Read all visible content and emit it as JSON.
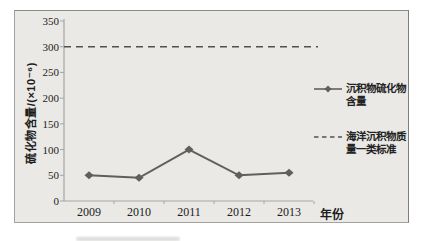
{
  "chart_data": {
    "type": "line",
    "title": "",
    "categories": [
      "2009",
      "2010",
      "2011",
      "2012",
      "2013"
    ],
    "series": [
      {
        "name": "沉积物硫化物含量",
        "style": "solid line with diamond markers",
        "color": "#615f5c",
        "values": [
          50,
          45,
          100,
          50,
          55
        ]
      },
      {
        "name": "海洋沉积物质量一类标准",
        "style": "dashed horizontal reference line",
        "color": "#515150",
        "constant_value": 300,
        "values": [
          300,
          300,
          300,
          300,
          300
        ]
      }
    ],
    "xlabel": "年份",
    "ylabel": "硫化物含量/(×10⁻⁶)",
    "ylim": [
      0,
      350
    ],
    "yticks": [
      0,
      50,
      100,
      150,
      200,
      250,
      300,
      350
    ],
    "grid": false,
    "legend_position": "right-outside"
  },
  "labels": {
    "y_axis": "硫化物含量/(×10⁻⁶)",
    "x_axis": "年份"
  },
  "legend": {
    "item1_line1": "沉积物硫化物",
    "item1_line2": "含量",
    "item2_line1": "海洋沉积物质",
    "item2_line2": "量一类标准"
  },
  "colors": {
    "figure_background": "#eae9e5",
    "page_background": "#ffffff",
    "series_line": "#615f5c",
    "standard_line": "#515150",
    "axis": "#a8a6a1",
    "text": "#1c1c1c"
  }
}
